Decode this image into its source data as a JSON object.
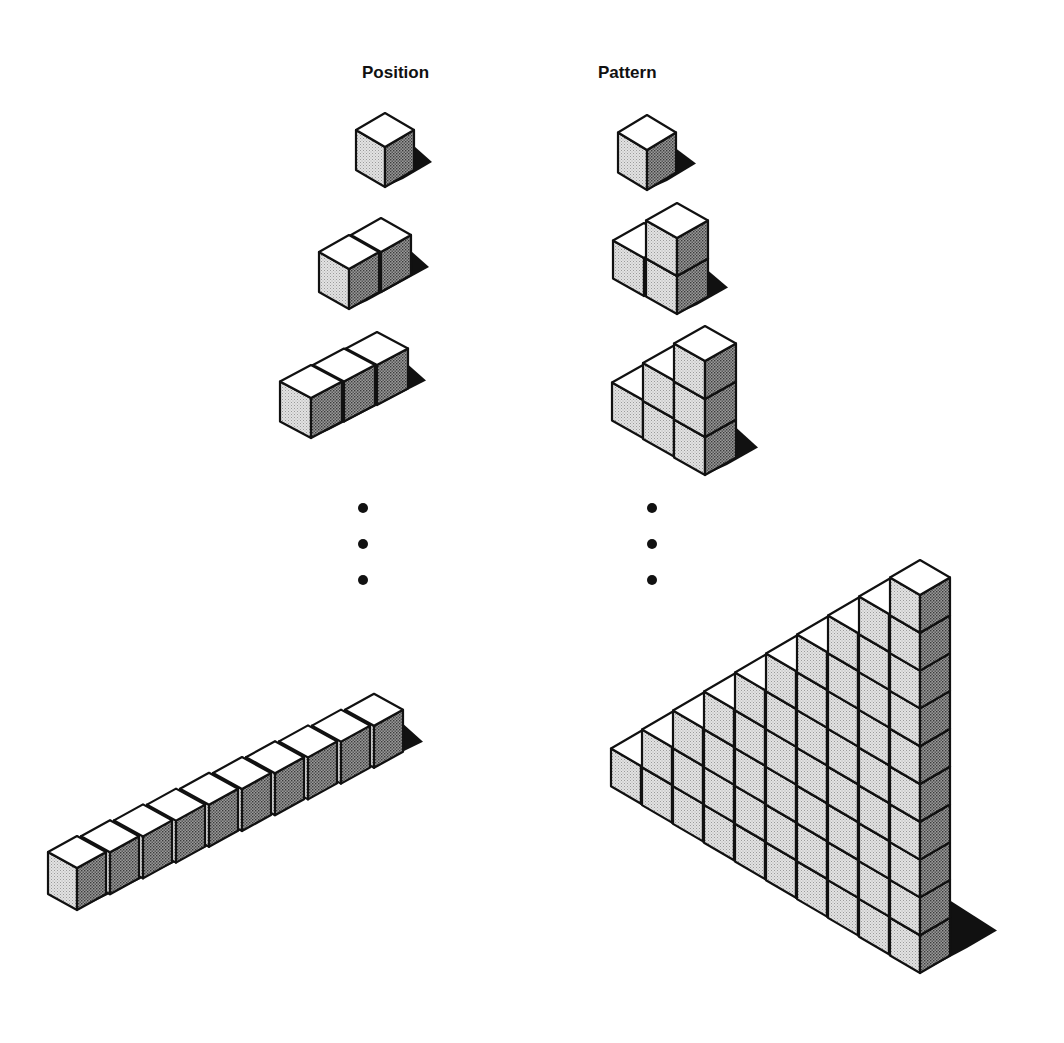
{
  "headings": {
    "position": {
      "text": "Position",
      "x": 362,
      "y": 64
    },
    "pattern": {
      "text": "Pattern",
      "x": 598,
      "y": 64
    }
  },
  "colors": {
    "background": "#ffffff",
    "stroke": "#111111",
    "top_face": "#ffffff",
    "left_face": "#d9d9d9",
    "right_face": "#8c8c8c",
    "shadow": "#111111",
    "dot": "#111111"
  },
  "ellipsis_dots": [
    {
      "column": "position",
      "x": 363,
      "ys": [
        508,
        544,
        580
      ],
      "r": 5
    },
    {
      "column": "pattern",
      "x": 652,
      "ys": [
        508,
        544,
        580
      ],
      "r": 5
    }
  ],
  "figures": [
    {
      "name": "position-figure-1",
      "column": "position",
      "kind": "row",
      "count": 1,
      "origin": [
        385,
        113
      ],
      "face": {
        "u": 29,
        "s": 17,
        "h": 40
      },
      "stepA": [
        31,
        -17
      ],
      "stepB": [
        31,
        17.5
      ],
      "shadow": {
        "dx": 18,
        "dy": -8,
        "rise": 24
      }
    },
    {
      "name": "position-figure-2",
      "column": "position",
      "kind": "row",
      "count": 2,
      "origin": [
        349,
        235
      ],
      "face": {
        "u": 30,
        "s": 17,
        "h": 40
      },
      "stepA": [
        32,
        -17
      ],
      "stepB": [
        31,
        17.5
      ],
      "shadow": {
        "dx": 18,
        "dy": -8,
        "rise": 24
      }
    },
    {
      "name": "position-figure-3",
      "column": "position",
      "kind": "row",
      "count": 3,
      "origin": [
        311,
        365
      ],
      "face": {
        "u": 31,
        "s": 16.5,
        "h": 40
      },
      "stepA": [
        33,
        -16.5
      ],
      "stepB": [
        31,
        17.5
      ],
      "shadow": {
        "dx": 18,
        "dy": -8,
        "rise": 24
      }
    },
    {
      "name": "position-figure-10",
      "column": "position",
      "kind": "row",
      "count": 10,
      "origin": [
        77,
        836
      ],
      "face": {
        "u": 29,
        "s": 16,
        "h": 42
      },
      "stepA": [
        33,
        -15.8
      ],
      "stepB": [
        31,
        17.5
      ],
      "shadow": {
        "dx": 20,
        "dy": -10,
        "rise": 28
      }
    },
    {
      "name": "pattern-figure-1",
      "column": "pattern",
      "kind": "staircase",
      "count": 1,
      "origin": [
        647,
        115
      ],
      "face": {
        "u": 29,
        "s": 17.5,
        "h": 40
      },
      "stepA": [
        31,
        -17
      ],
      "stepB": [
        31,
        18
      ],
      "shadow": {
        "dx": 20,
        "dy": -9,
        "rise": 24
      }
    },
    {
      "name": "pattern-figure-2",
      "column": "pattern",
      "kind": "staircase",
      "count": 2,
      "origin": [
        644,
        223
      ],
      "face": {
        "u": 31,
        "s": 17.5,
        "h": 38
      },
      "stepA": [
        31,
        -17
      ],
      "stepB": [
        33,
        18
      ],
      "shadow": {
        "dx": 20,
        "dy": -9,
        "rise": 26
      }
    },
    {
      "name": "pattern-figure-3",
      "column": "pattern",
      "kind": "staircase",
      "count": 3,
      "origin": [
        643,
        365
      ],
      "face": {
        "u": 31,
        "s": 17.5,
        "h": 38
      },
      "stepA": [
        31,
        -17
      ],
      "stepB": [
        31,
        18.5
      ],
      "shadow": {
        "dx": 22,
        "dy": -10,
        "rise": 30
      }
    },
    {
      "name": "pattern-figure-10",
      "column": "pattern",
      "kind": "staircase",
      "count": 10,
      "origin": [
        641,
        731
      ],
      "face": {
        "u": 30,
        "s": 17.5,
        "h": 37.8
      },
      "stepA": [
        31,
        -17
      ],
      "stepB": [
        31,
        18.8
      ],
      "shadow": {
        "dx": 47,
        "dy": -25,
        "rise": 55
      }
    }
  ]
}
